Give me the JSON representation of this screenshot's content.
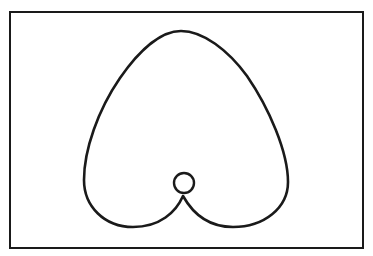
{
  "diagram": {
    "type": "curve-plot",
    "colors": {
      "background": "#ffffff",
      "stroke": "#1a1a1a"
    },
    "frame": {
      "x": 10,
      "y": 12,
      "width": 353,
      "height": 236,
      "stroke_width": 2
    },
    "curve": {
      "top": [
        181,
        31
      ],
      "left_extreme": [
        83,
        178
      ],
      "right_extreme": [
        289,
        178
      ],
      "left_lobe_bottom": [
        135,
        227
      ],
      "right_lobe_bottom": [
        233,
        227
      ],
      "cusp": [
        183,
        196
      ],
      "stroke_width": 2.6
    },
    "inner_loop": {
      "cx": 184,
      "cy": 184,
      "r": 10
    }
  }
}
